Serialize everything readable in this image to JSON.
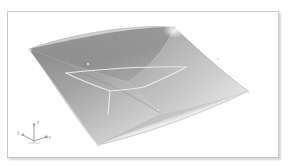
{
  "viewport": {
    "background_color": "#ffffff",
    "width": 288,
    "height": 167
  },
  "render_frame": {
    "name": "3D Viewport",
    "border_color": "#c9c9c9",
    "background_color": "#ffffff",
    "shadow": true
  },
  "scene": {
    "object_name": "Hyperbolic Paraboloid Surface",
    "shading": "grayscale-gradient",
    "surface_light_color": "#f2f2f2",
    "surface_mid_color": "#b4b4b4",
    "surface_dark_color": "#7d7d7d",
    "surface_edge_color": "#9a9a9a",
    "wireframe_color": "#ededed",
    "vertex_marker_color": "#d8d8d8",
    "corners": [
      {
        "name": "top-peak",
        "x": 173,
        "y": 26
      },
      {
        "name": "left-peak",
        "x": 28,
        "y": 48
      },
      {
        "name": "right-valley",
        "x": 247,
        "y": 90
      },
      {
        "name": "bottom-valley",
        "x": 97,
        "y": 144
      }
    ],
    "vertex_markers": [
      {
        "x": 173,
        "y": 27
      },
      {
        "x": 28,
        "y": 49
      },
      {
        "x": 247,
        "y": 90
      },
      {
        "x": 97,
        "y": 144
      },
      {
        "x": 88,
        "y": 62
      },
      {
        "x": 157,
        "y": 108
      },
      {
        "x": 216,
        "y": 57
      }
    ]
  },
  "axis_gizmo": {
    "name": "coordinate-axis-indicator",
    "origin_label": "",
    "axes": [
      {
        "id": "x",
        "label": "x",
        "color": "#8a8a8a"
      },
      {
        "id": "y",
        "label": "y",
        "color": "#8a8a8a"
      },
      {
        "id": "z",
        "label": "z",
        "color": "#8a8a8a"
      }
    ]
  }
}
